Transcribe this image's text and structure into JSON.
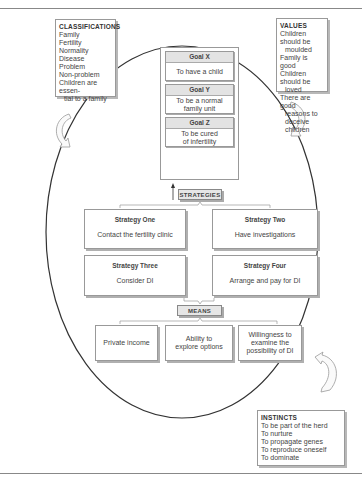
{
  "classifications": {
    "title": "CLASSIFICATIONS",
    "items": [
      "Family",
      "Fertility",
      "Normality",
      "Disease",
      "Problem",
      "Non-problem",
      "Children are essen-",
      "tial to a family"
    ]
  },
  "values": {
    "title": "VALUES",
    "items": [
      "Children should be",
      "moulded",
      "Family is good",
      "Children should be",
      "loved",
      "There are good",
      "reasons to deceive",
      "children"
    ]
  },
  "goals": [
    {
      "title": "Goal X",
      "lines": [
        "To have a child"
      ]
    },
    {
      "title": "Goal Y",
      "lines": [
        "To be a normal",
        "family unit"
      ]
    },
    {
      "title": "Goal Z",
      "lines": [
        "To be cured",
        "of infertility"
      ]
    }
  ],
  "strategies_label": "STRATEGIES",
  "strategies": [
    {
      "title": "Strategy One",
      "desc": "Contact the fertility clinic"
    },
    {
      "title": "Strategy Two",
      "desc": "Have investigations"
    },
    {
      "title": "Strategy Three",
      "desc": "Consider DI"
    },
    {
      "title": "Strategy Four",
      "desc": "Arrange and pay for DI"
    }
  ],
  "means_label": "MEANS",
  "means": [
    {
      "lines": [
        "Private income"
      ]
    },
    {
      "lines": [
        "Ability to",
        "explore options"
      ]
    },
    {
      "lines": [
        "Willingness to",
        "examine the",
        "possibility of DI"
      ]
    }
  ],
  "instincts": {
    "title": "INSTINCTS",
    "items": [
      "To be part of the herd",
      "To nurture",
      "To propagate genes",
      "To reproduce oneself",
      "To dominate"
    ]
  },
  "colors": {
    "outline": "#333333",
    "box_border": "#999999",
    "header_fill": "#e3e3e3",
    "shadow": "#b0b0b0"
  }
}
